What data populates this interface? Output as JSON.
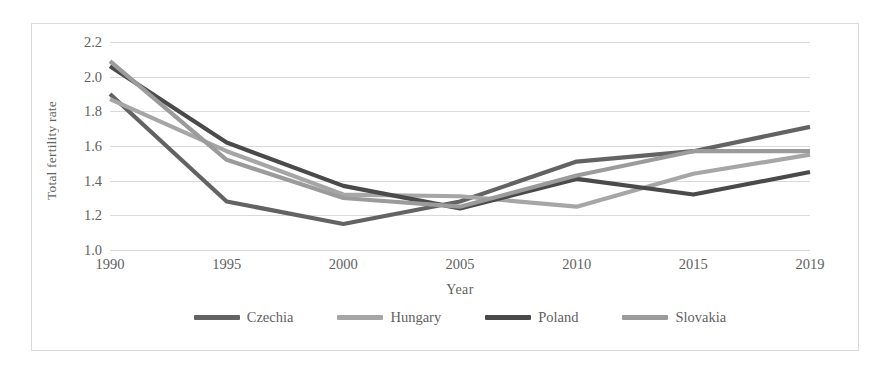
{
  "chart_data": {
    "type": "line",
    "title": "",
    "xlabel": "Year",
    "ylabel": "Total fertility rate",
    "categories": [
      "1990",
      "1995",
      "2000",
      "2005",
      "2010",
      "2015",
      "2019"
    ],
    "ylim": [
      1.0,
      2.2
    ],
    "y_ticks": [
      "1.0",
      "1.2",
      "1.4",
      "1.6",
      "1.8",
      "2.0",
      "2.2"
    ],
    "y_tick_values": [
      1.0,
      1.2,
      1.4,
      1.6,
      1.8,
      2.0,
      2.2
    ],
    "grid": "horizontal",
    "legend_position": "bottom",
    "series": [
      {
        "name": "Czechia",
        "color": "#636363",
        "values": [
          1.9,
          1.28,
          1.15,
          1.28,
          1.51,
          1.57,
          1.71
        ]
      },
      {
        "name": "Hungary",
        "color": "#a6a6a6",
        "values": [
          1.87,
          1.57,
          1.32,
          1.31,
          1.25,
          1.44,
          1.55
        ]
      },
      {
        "name": "Poland",
        "color": "#4a4a4a",
        "values": [
          2.06,
          1.62,
          1.37,
          1.24,
          1.41,
          1.32,
          1.45
        ]
      },
      {
        "name": "Slovakia",
        "color": "#9b9b9b",
        "values": [
          2.09,
          1.52,
          1.3,
          1.25,
          1.43,
          1.57,
          1.57
        ]
      }
    ]
  },
  "style": {
    "grid_color": "#d9d9d9",
    "border_color": "#d9d9d9",
    "text_color": "#5f5f5f",
    "background": "#ffffff"
  }
}
